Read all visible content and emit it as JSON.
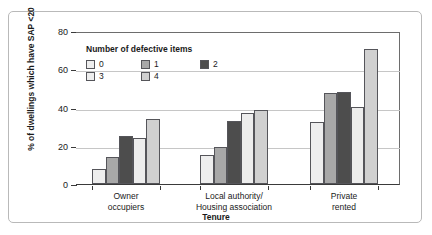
{
  "chart_data": {
    "type": "bar",
    "title": "",
    "xlabel": "Tenure",
    "ylabel": "% of dwellings which have SAP <20",
    "ylim": [
      0,
      80
    ],
    "yticks": [
      "0",
      "20",
      "40",
      "60",
      "80"
    ],
    "grid": "horizontal",
    "legend_position": "inside-top-left",
    "legend_title": "Number of defective items",
    "categories": [
      "Owner\noccupiers",
      "Local authority/\nHousing association",
      "Private\nrented"
    ],
    "series": [
      {
        "name": "0",
        "values": [
          8,
          15,
          32.5
        ],
        "color": "#eeeeee"
      },
      {
        "name": "1",
        "values": [
          14,
          19.5,
          47.5
        ],
        "color": "#a8a8a8"
      },
      {
        "name": "2",
        "values": [
          25,
          33,
          48
        ],
        "color": "#4d4d4d"
      },
      {
        "name": "3",
        "values": [
          24,
          37,
          40.5
        ],
        "color": "#ededed"
      },
      {
        "name": "4",
        "values": [
          34,
          38.5,
          70.5
        ],
        "color": "#d0d0d0"
      }
    ]
  },
  "colors": {
    "axis": "#3a3a3a",
    "grid": "#c6c6c6",
    "frame": "#b9b9b9",
    "text": "#1a1a1a",
    "bar_outline": "#55555a"
  }
}
